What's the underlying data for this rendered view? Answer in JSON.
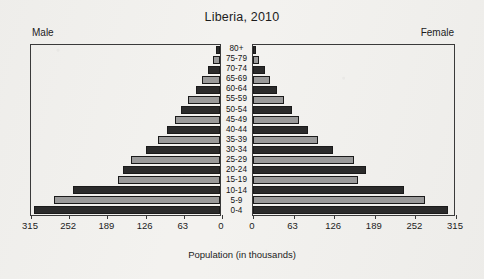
{
  "chart_data": {
    "type": "bar",
    "subtype": "population-pyramid",
    "title": "Liberia, 2010",
    "xlabel": "Population (in thousands)",
    "ylabel": "",
    "grid": false,
    "legend_position": "top-corners",
    "xlim": [
      0,
      315
    ],
    "xticks": [
      0,
      63,
      126,
      189,
      252,
      315
    ],
    "categories": [
      "0-4",
      "5-9",
      "10-14",
      "15-19",
      "20-24",
      "25-29",
      "30-34",
      "35-39",
      "40-44",
      "45-49",
      "50-54",
      "55-59",
      "60-64",
      "65-69",
      "70-74",
      "75-79",
      "80+"
    ],
    "series": [
      {
        "name": "Male",
        "direction": "left",
        "values": [
          307,
          273,
          243,
          168,
          160,
          146,
          122,
          103,
          88,
          75,
          65,
          52,
          40,
          29,
          20,
          12,
          6
        ]
      },
      {
        "name": "Female",
        "direction": "right",
        "values": [
          303,
          267,
          235,
          163,
          175,
          156,
          124,
          101,
          85,
          72,
          61,
          48,
          37,
          27,
          18,
          10,
          5
        ]
      }
    ],
    "colors": {
      "dark_bar": "#2b2b2b",
      "light_bar": "#9a9a9a",
      "frame": "#3a3a3a",
      "background": "#f3f2ef",
      "text": "#1c1c1c"
    }
  },
  "title": "Liberia, 2010",
  "left_panel_label": "Male",
  "right_panel_label": "Female",
  "axis_caption": "Population (in thousands)",
  "left_axis_ticks": [
    "315",
    "252",
    "189",
    "126",
    "63",
    "0"
  ],
  "right_axis_ticks": [
    "0",
    "63",
    "126",
    "189",
    "252",
    "315"
  ],
  "age_labels": [
    "80+",
    "75-79",
    "70-74",
    "65-69",
    "60-64",
    "55-59",
    "50-54",
    "45-49",
    "40-44",
    "35-39",
    "30-34",
    "25-29",
    "20-24",
    "15-19",
    "10-14",
    "5-9",
    "0-4"
  ]
}
